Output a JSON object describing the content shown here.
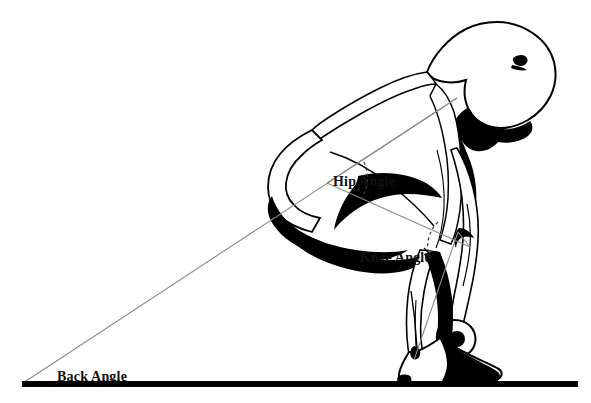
{
  "figure": {
    "background_color": "#ffffff",
    "line_color": "#000000",
    "construction_line_color": "#8a8a8a",
    "label_color": "#111111"
  },
  "labels": {
    "hip_angle": "Hip Angle",
    "knee_angle": "Knee Angle",
    "back_angle": "Back Angle"
  },
  "geometry": {
    "ground_line": {
      "x1": 22,
      "y1": 384,
      "x2": 578,
      "y2": 384,
      "thickness": 6
    },
    "vertices": {
      "hip": {
        "x": 327,
        "y": 183
      },
      "knee": {
        "x": 455,
        "y": 236
      },
      "shoulder": {
        "x": 457,
        "y": 98
      },
      "ankle": {
        "x": 414,
        "y": 360
      },
      "back_floor_origin": {
        "x": 23,
        "y": 383
      }
    },
    "angle_lines": [
      {
        "name": "back-line",
        "from": "back_floor_origin",
        "to": "shoulder"
      },
      {
        "name": "hip-to-shoulder-line",
        "from": "hip",
        "to": "shoulder"
      },
      {
        "name": "hip-to-knee-line",
        "from": "hip",
        "to": "knee"
      },
      {
        "name": "knee-to-ankle-line",
        "from": "knee",
        "to": "ankle"
      }
    ],
    "angle_arcs": [
      {
        "name": "hip-angle-arc",
        "vertex": "hip",
        "style": "dashed"
      },
      {
        "name": "knee-angle-arc",
        "vertex": "knee",
        "style": "dashed"
      }
    ]
  }
}
